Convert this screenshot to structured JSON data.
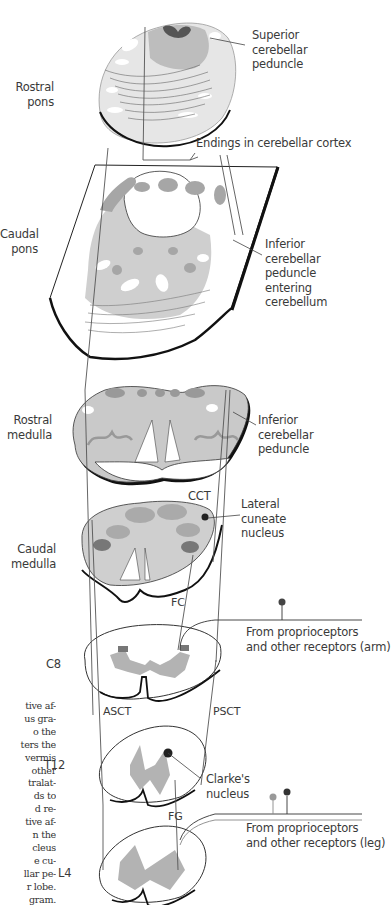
{
  "diagram": {
    "levels": [
      {
        "id": "rostral-pons",
        "label": "Rostral\npons"
      },
      {
        "id": "caudal-pons",
        "label": "Caudal\npons"
      },
      {
        "id": "rostral-medulla",
        "label": "Rostral\nmedulla"
      },
      {
        "id": "caudal-medulla",
        "label": "Caudal\nmedulla"
      },
      {
        "id": "c8",
        "label": "C8"
      },
      {
        "id": "t12",
        "label": "T12"
      },
      {
        "id": "l4",
        "label": "L4"
      }
    ],
    "structures": {
      "superior_cerebellar_peduncle": "Superior\ncerebellar\npeduncle",
      "endings": "Endings in cerebellar cortex",
      "icp_entering": "Inferior\ncerebellar\npeduncle\nentering\ncerebellum",
      "icp": "Inferior\ncerebellar\npeduncle",
      "lateral_cuneate": "Lateral\ncuneate\nnucleus",
      "clarkes": "Clarke's\nnucleus"
    },
    "tracts": {
      "cct": "CCT",
      "fc": "FC",
      "asct": "ASCT",
      "psct": "PSCT",
      "fg": "FG"
    },
    "inputs": {
      "arm": "From proprioceptors\nand other receptors (arm)",
      "leg": "From proprioceptors\nand other receptors (leg)"
    },
    "caption_fragment": [
      "tive af-",
      "us gra-",
      "o the",
      "ters the",
      "vermis",
      "other",
      "tralat-",
      "ds to",
      "d re-",
      "tive af-",
      "n the",
      "cleus",
      "e cu-",
      "llar pe-",
      "r lobe.",
      "gram."
    ],
    "colors": {
      "light_gray": "#d9d9d9",
      "mid_gray": "#b9b9b9",
      "dark_gray": "#8f8f8f",
      "darkest": "#505050",
      "outline": "#1a1a1a",
      "line": "#555555"
    }
  }
}
